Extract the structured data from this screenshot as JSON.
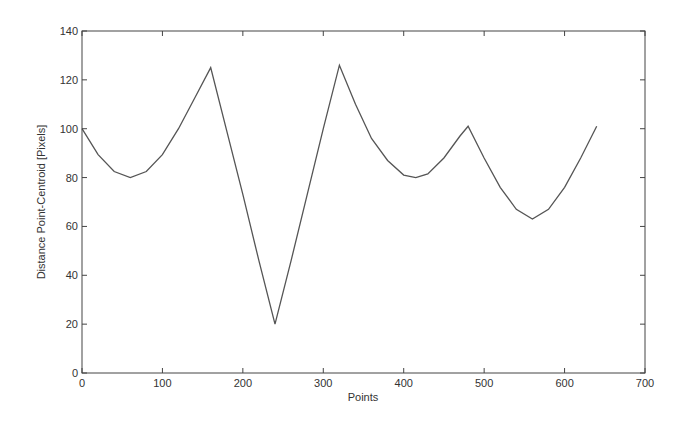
{
  "chart_data": {
    "type": "line",
    "title": "",
    "xlabel": "Points",
    "ylabel": "Distance Point-Centroid [Pixels]",
    "xlim": [
      0,
      700
    ],
    "ylim": [
      0,
      140
    ],
    "xticks": [
      0,
      100,
      200,
      300,
      400,
      500,
      600,
      700
    ],
    "yticks": [
      0,
      20,
      40,
      60,
      80,
      100,
      120,
      140
    ],
    "grid": false,
    "legend": null,
    "series": [
      {
        "name": "distance",
        "color": "#555555",
        "x": [
          0,
          20,
          40,
          60,
          80,
          100,
          120,
          140,
          160,
          180,
          200,
          220,
          240,
          260,
          280,
          300,
          320,
          340,
          360,
          380,
          400,
          415,
          430,
          450,
          470,
          480,
          500,
          520,
          540,
          560,
          580,
          600,
          620,
          640
        ],
        "y": [
          100,
          89.4,
          82.5,
          80,
          82.5,
          89.4,
          100,
          112.5,
          125,
          99,
          73,
          46,
          20,
          46,
          73,
          100,
          126,
          110,
          96,
          87,
          81,
          80,
          81.5,
          88,
          97,
          101,
          88,
          76,
          67,
          63,
          67,
          76,
          88,
          101
        ]
      }
    ]
  },
  "axes": {
    "xlabel": "Points",
    "ylabel": "Distance Point-Centroid [Pixels]",
    "xtick_labels": [
      "0",
      "100",
      "200",
      "300",
      "400",
      "500",
      "600",
      "700"
    ],
    "ytick_labels": [
      "0",
      "20",
      "40",
      "60",
      "80",
      "100",
      "120",
      "140"
    ]
  }
}
